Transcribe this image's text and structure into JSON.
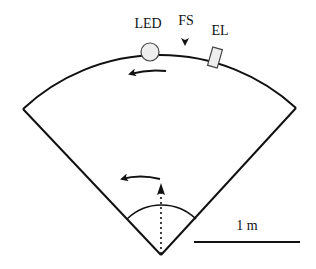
{
  "diagram": {
    "labels": {
      "led": "LED",
      "fs": "FS",
      "el": "EL",
      "scale": "1 m"
    },
    "colors": {
      "stroke": "#111111",
      "component_fill": "#eeeeee",
      "background": "#ffffff"
    },
    "geometry": {
      "apex": [
        161,
        255
      ],
      "outer_radius": 201,
      "inner_radius": 49.5,
      "left_corner": [
        23,
        109
      ],
      "right_corner": [
        296,
        108
      ],
      "scale_bar": {
        "x1": 194,
        "x2": 300,
        "y": 242
      }
    }
  }
}
